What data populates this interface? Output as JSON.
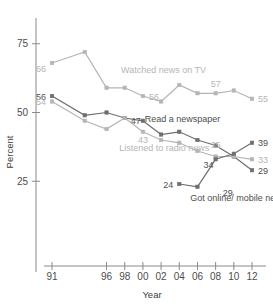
{
  "chart_data": {
    "type": "line",
    "title": "",
    "xlabel": "Year",
    "ylabel": "Percent",
    "grid": false,
    "legend_position": "inline-annotations",
    "x": [
      1991,
      1993,
      1994,
      1996,
      1998,
      2000,
      2002,
      2004,
      2006,
      2008,
      2010,
      2012
    ],
    "xtick_labels": [
      "91",
      "96",
      "98",
      "00",
      "02",
      "04",
      "06",
      "08",
      "10",
      "12"
    ],
    "xtick_values": [
      1991,
      1996,
      1998,
      2000,
      2002,
      2004,
      2006,
      2008,
      2010,
      2012
    ],
    "ytick_labels": [
      "25",
      "50",
      "75"
    ],
    "ytick_values": [
      25,
      50,
      75
    ],
    "ylim": [
      0,
      80
    ],
    "xlim": [
      1990,
      2013
    ],
    "series": [
      {
        "name": "Watched news on TV",
        "color": "#b5b5b5",
        "label_color": "#b5b5b5",
        "x": [
          1991,
          1994,
          1996,
          1998,
          2000,
          2002,
          2004,
          2006,
          2008,
          2010,
          2012
        ],
        "values": [
          68,
          72,
          59,
          59,
          56,
          54,
          60,
          57,
          57,
          58,
          55
        ],
        "point_labels": [
          {
            "x": 1991,
            "value": 66,
            "text": "66",
            "pos": "left"
          },
          {
            "x": 2000,
            "value": 56,
            "text": "56",
            "pos": "right"
          },
          {
            "x": 2008,
            "value": 57,
            "text": "57",
            "pos": "above"
          },
          {
            "x": 2012,
            "value": 55,
            "text": "55",
            "pos": "right"
          }
        ],
        "annotation": {
          "text": "Watched news on TV",
          "x": 1997.6,
          "y": 64.5
        }
      },
      {
        "name": "Read a newspaper",
        "color": "#6e6e6e",
        "label_color": "#4d4d4d",
        "x": [
          1991,
          1994,
          1996,
          1998,
          2000,
          2002,
          2004,
          2006,
          2008,
          2010,
          2012
        ],
        "values": [
          56,
          49,
          50,
          48,
          47,
          42,
          43,
          40,
          38,
          34,
          29
        ],
        "point_labels": [
          {
            "x": 1991,
            "value": 56,
            "text": "56",
            "pos": "left"
          },
          {
            "x": 1998,
            "value": 47,
            "text": "47",
            "pos": "right"
          },
          {
            "x": 2012,
            "value": 29,
            "text": "29",
            "pos": "right"
          }
        ],
        "annotation": {
          "text": "Read a newspaper",
          "x": 2000.2,
          "y": 46.5
        }
      },
      {
        "name": "Listened to radio news",
        "color": "#b5b5b5",
        "label_color": "#b5b5b5",
        "x": [
          1991,
          1994,
          1996,
          1998,
          2000,
          2002,
          2004,
          2006,
          2008,
          2010,
          2012
        ],
        "values": [
          54,
          47,
          44,
          48,
          43,
          40,
          39,
          36,
          34,
          34,
          33
        ],
        "point_labels": [
          {
            "x": 1991,
            "value": 54,
            "text": "54",
            "pos": "left"
          },
          {
            "x": 2000,
            "value": 43,
            "text": "43",
            "pos": "below"
          },
          {
            "x": 2008,
            "value": 35,
            "text": "35",
            "pos": "above"
          },
          {
            "x": 2012,
            "value": 33,
            "text": "33",
            "pos": "right"
          }
        ],
        "annotation": {
          "text": "Listened to radio news",
          "x": 1997.4,
          "y": 36.0
        }
      },
      {
        "name": "Got online/ mobile news",
        "color": "#6e6e6e",
        "label_color": "#4d4d4d",
        "x": [
          2004,
          2006,
          2008,
          2010,
          2012
        ],
        "values": [
          24,
          23,
          33,
          35,
          39
        ],
        "point_labels": [
          {
            "x": 2004,
            "value": 24,
            "text": "24",
            "pos": "left"
          },
          {
            "x": 2008,
            "value": 34,
            "text": "34",
            "pos": "leftbelow"
          },
          {
            "x": 2008,
            "value": 23,
            "text": "29",
            "pos": "belowright"
          },
          {
            "x": 2012,
            "value": 39,
            "text": "39",
            "pos": "right"
          }
        ],
        "annotation": {
          "text": "Got online/ mobile news",
          "x": 2005.2,
          "y": 18.0
        }
      }
    ]
  }
}
